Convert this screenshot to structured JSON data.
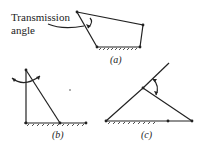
{
  "labels": {
    "transmission_line1": "Transmission",
    "transmission_line2": "angle"
  },
  "captions": {
    "a": "(a)",
    "b": "(b)",
    "c": "(c)"
  }
}
